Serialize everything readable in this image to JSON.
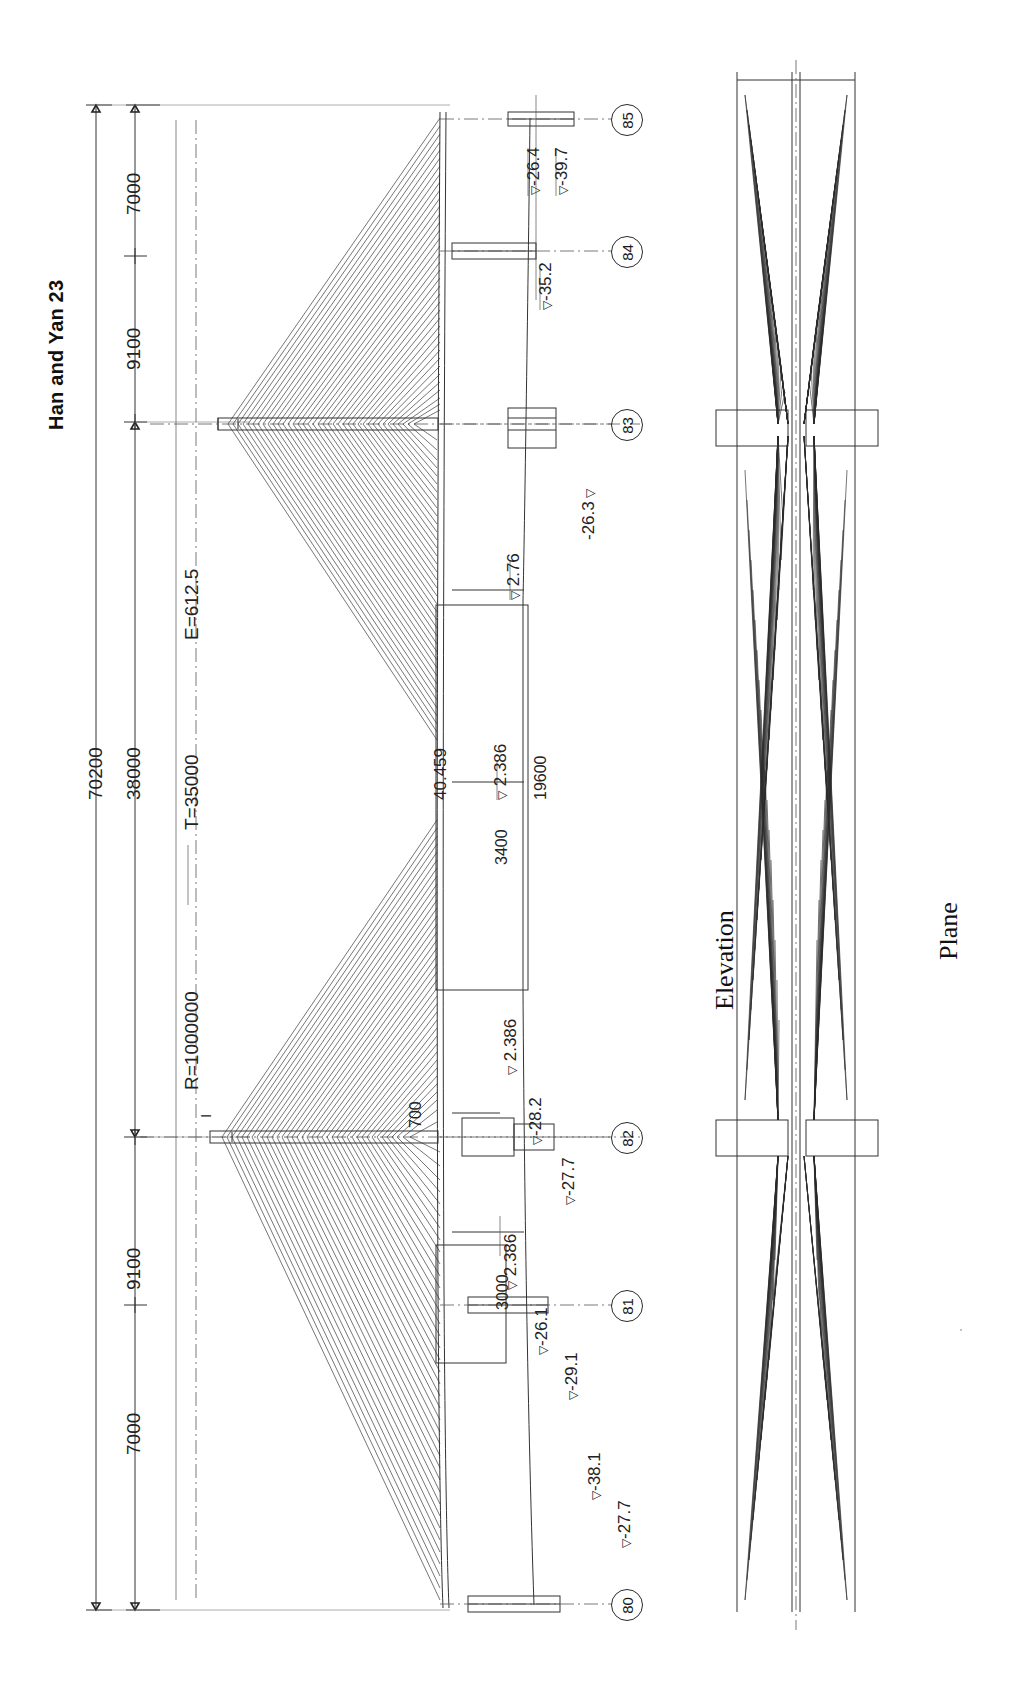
{
  "drawing": {
    "title": "Han and Yan  23",
    "views": [
      {
        "name": "elevation",
        "label": "Elevation"
      },
      {
        "name": "plane",
        "label": "Plane"
      }
    ]
  },
  "dimensions": {
    "overall": "70200",
    "main_span": "38000",
    "segments": [
      "7000",
      "9100",
      "9100",
      "7000"
    ],
    "curve": {
      "radius_label": "R=1000000",
      "tangent_label": "T=35000",
      "external_label": "E=612.5"
    },
    "deck": {
      "girder_depth_left": "3000",
      "girder_depth_right": "3400",
      "panel_width": "19600",
      "pylon_width": "700"
    }
  },
  "elevations": {
    "deck_levels": [
      "2.386",
      "2.386",
      "2.386",
      "2.76"
    ],
    "pylon_top": "40.459",
    "node_85": [
      "-26.4",
      "-39.7"
    ],
    "node_84": [
      "-35.2"
    ],
    "node_83": [
      "-26.3"
    ],
    "node_82": [
      "-28.2",
      "-27.7"
    ],
    "node_81": [
      "-26.1",
      "-29.1"
    ],
    "node_80": [
      "-38.1",
      "-27.7"
    ]
  },
  "nodes": [
    {
      "id": "85",
      "label": "85"
    },
    {
      "id": "84",
      "label": "84"
    },
    {
      "id": "83",
      "label": "83"
    },
    {
      "id": "82",
      "label": "82"
    },
    {
      "id": "81",
      "label": "81"
    },
    {
      "id": "80",
      "label": "80"
    }
  ],
  "marks": {
    "pylon_mark": "I"
  },
  "style": {
    "ink": "#1a1a1a",
    "line": "#333333",
    "paper": "#ffffff"
  }
}
